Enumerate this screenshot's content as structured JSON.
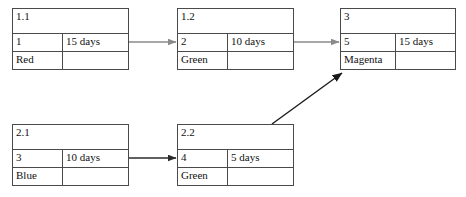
{
  "diagram": {
    "type": "activity-network",
    "background_color": "#ffffff",
    "border_color": "#4a4a4a",
    "text_color": "#111111",
    "nodes": [
      {
        "key": "n11",
        "label": "1.1",
        "sequence": "1",
        "duration": "15 days",
        "resource": "Red",
        "extra": ""
      },
      {
        "key": "n12",
        "label": "1.2",
        "sequence": "2",
        "duration": "10 days",
        "resource": "Green",
        "extra": ""
      },
      {
        "key": "n3",
        "label": "3",
        "sequence": "5",
        "duration": "15 days",
        "resource": "Magenta",
        "extra": ""
      },
      {
        "key": "n21",
        "label": "2.1",
        "sequence": "3",
        "duration": "10 days",
        "resource": "Blue",
        "extra": ""
      },
      {
        "key": "n22",
        "label": "2.2",
        "sequence": "4",
        "duration": "5 days",
        "resource": "Green",
        "extra": ""
      }
    ],
    "connectors": [
      {
        "key": "c1",
        "from": "1.1",
        "to": "1.2",
        "style": "straight",
        "color": "#8a8a8a"
      },
      {
        "key": "c2",
        "from": "1.2",
        "to": "3",
        "style": "straight",
        "color": "#8a8a8a"
      },
      {
        "key": "c3",
        "from": "2.1",
        "to": "2.2",
        "style": "straight",
        "color": "#2b2b2b"
      },
      {
        "key": "c4",
        "from": "2.2",
        "to": "3",
        "style": "diagonal",
        "color": "#1a1a1a"
      }
    ]
  }
}
